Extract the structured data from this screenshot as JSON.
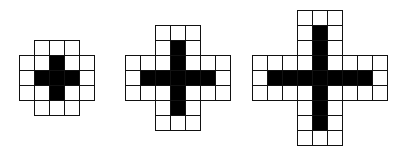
{
  "figure": {
    "shapes": [
      {
        "id": "small-plus",
        "grid_size": 5,
        "left": 19,
        "top": 40,
        "cell": 15,
        "rows": [
          [
            1,
            3
          ],
          [
            0,
            4
          ],
          [
            0,
            4
          ],
          [
            0,
            4
          ],
          [
            1,
            3
          ]
        ],
        "cross_center": [
          2,
          2
        ],
        "cross_arm": 1
      },
      {
        "id": "medium-plus",
        "grid_size": 7,
        "left": 125,
        "top": 25,
        "cell": 15,
        "rows": [
          [
            2,
            4
          ],
          [
            2,
            4
          ],
          [
            0,
            6
          ],
          [
            0,
            6
          ],
          [
            0,
            6
          ],
          [
            2,
            4
          ],
          [
            2,
            4
          ]
        ],
        "cross_center": [
          3,
          3
        ],
        "cross_arm": 2
      },
      {
        "id": "large-plus",
        "grid_size": 9,
        "left": 252,
        "top": 10,
        "cell": 15,
        "rows": [
          [
            3,
            5
          ],
          [
            3,
            5
          ],
          [
            3,
            5
          ],
          [
            0,
            8
          ],
          [
            0,
            8
          ],
          [
            0,
            8
          ],
          [
            3,
            5
          ],
          [
            3,
            5
          ],
          [
            3,
            5
          ]
        ],
        "cross_center": [
          4,
          4
        ],
        "cross_arm": 3
      }
    ],
    "colors": {
      "fill": "#000000",
      "empty": "#ffffff",
      "grid_line": "#111111"
    }
  }
}
